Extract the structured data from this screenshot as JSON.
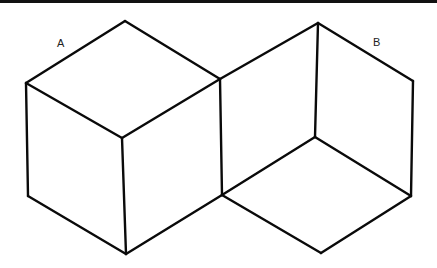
{
  "figure": {
    "labels": {
      "a": "A",
      "b": "B"
    },
    "colors": {
      "line": "#0a0a0a",
      "background": "#ffffff",
      "top_rule": "#111111"
    },
    "cube_a": {
      "vertices": {
        "top": [
          125,
          21
        ],
        "left": [
          26,
          83
        ],
        "right_shared": [
          220,
          79
        ],
        "front_center": [
          122,
          138
        ],
        "bottom_left": [
          28,
          196
        ],
        "bottom": [
          126,
          254
        ],
        "bottom_right_shared": [
          222,
          195
        ]
      }
    },
    "cube_b": {
      "vertices": {
        "top": [
          318,
          23
        ],
        "right": [
          413,
          81
        ],
        "inner_center": [
          315,
          137
        ],
        "bottom_right": [
          411,
          196
        ],
        "bottom": [
          321,
          253
        ],
        "left_shared_top": [
          220,
          79
        ],
        "left_shared_bottom": [
          222,
          195
        ]
      }
    }
  }
}
